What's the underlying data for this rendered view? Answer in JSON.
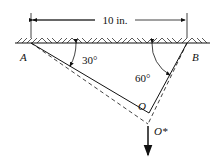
{
  "diagram": {
    "dimension_label": "10 in.",
    "points": {
      "A": "A",
      "B": "B",
      "O": "O",
      "O_star": "O*"
    },
    "angles": {
      "at_A": "30°",
      "at_B": "60°"
    },
    "colors": {
      "line": "#111111",
      "background": "#ffffff"
    }
  }
}
